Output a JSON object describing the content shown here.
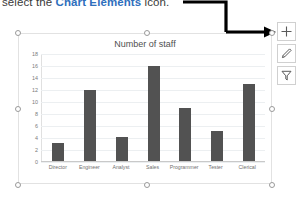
{
  "instruction": {
    "prefix": "select the ",
    "highlight": "Chart Elements",
    "suffix": " icon.",
    "highlight_color": "#2f6fbd"
  },
  "chart_data": {
    "type": "bar",
    "title": "Number of staff",
    "categories": [
      "Director",
      "Engineer",
      "Analyst",
      "Sales",
      "Programmer",
      "Tester",
      "Clerical"
    ],
    "values": [
      3,
      12,
      4,
      16,
      9,
      5,
      13
    ],
    "xlabel": "",
    "ylabel": "",
    "ylim": [
      0,
      18
    ],
    "yticks": [
      18,
      16,
      14,
      12,
      10,
      8,
      6,
      4,
      2,
      0
    ],
    "grid": true,
    "legend": "none",
    "bar_color": "#525252"
  },
  "chart_tools": [
    {
      "name": "chart-elements",
      "glyph": "+"
    },
    {
      "name": "chart-styles",
      "glyph": "brush"
    },
    {
      "name": "chart-filters",
      "glyph": "funnel"
    }
  ],
  "selection": {
    "handles": 8
  }
}
